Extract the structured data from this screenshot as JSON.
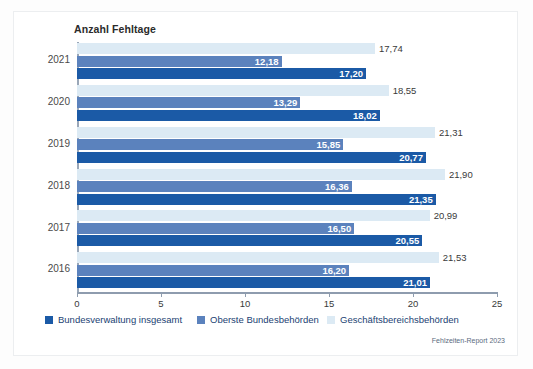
{
  "figure": {
    "title": "Anzahl Fehltage",
    "source_note": "Fehlzeiten-Report 2023"
  },
  "colors": {
    "dark": "#1b5aa6",
    "mid": "#5b82bd",
    "light": "#dceaf4",
    "axis": "#8e9cae",
    "card_background": "#ffffff",
    "page_background": "#fdfdfd"
  },
  "legend": {
    "items": [
      {
        "label": "Bundesverwaltung insgesamt",
        "color": "#1b5aa6",
        "key": "dark"
      },
      {
        "label": "Oberste Bundesbehörden",
        "color": "#5b82bd",
        "key": "mid"
      },
      {
        "label": "Geschäftsbereichsbehörden",
        "color": "#dceaf4",
        "key": "light"
      }
    ]
  },
  "axis": {
    "x_ticks": [
      "0",
      "5",
      "10",
      "15",
      "20",
      "25"
    ],
    "x_min": 0,
    "x_max": 25,
    "y_categories": [
      "2021",
      "2020",
      "2019",
      "2018",
      "2017",
      "2016"
    ]
  },
  "chart_data": {
    "type": "bar",
    "orientation": "horizontal",
    "title": "Anzahl Fehltage",
    "xlabel": "Anzahl Fehltage",
    "ylabel": "",
    "xlim": [
      0,
      25
    ],
    "grid": false,
    "legend_position": "bottom",
    "categories": [
      "2021",
      "2020",
      "2019",
      "2018",
      "2017",
      "2016"
    ],
    "series": [
      {
        "name": "Bundesverwaltung insgesamt",
        "color": "#1b5aa6",
        "values": [
          17.2,
          18.02,
          20.77,
          21.35,
          20.55,
          21.01
        ],
        "labels": [
          "17,20",
          "18,02",
          "20,77",
          "21,35",
          "20,55",
          "21,01"
        ]
      },
      {
        "name": "Oberste Bundesbehörden",
        "color": "#5b82bd",
        "values": [
          12.18,
          13.29,
          15.85,
          16.36,
          16.5,
          16.2
        ],
        "labels": [
          "12,18",
          "13,29",
          "15,85",
          "16,36",
          "16,50",
          "16,20"
        ]
      },
      {
        "name": "Geschäftsbereichsbehörden",
        "color": "#dceaf4",
        "values": [
          17.74,
          18.55,
          21.31,
          21.9,
          20.99,
          21.53
        ],
        "labels": [
          "17,74",
          "18,55",
          "21,31",
          "21,90",
          "20,99",
          "21,53"
        ]
      }
    ],
    "annotations": [
      "Fehlzeiten-Report 2023"
    ]
  },
  "groups": [
    {
      "year": "2021",
      "bars": [
        {
          "series": "Geschäftsbereichsbehörden",
          "key": "light",
          "value": 17.74,
          "label": "17,74"
        },
        {
          "series": "Oberste Bundesbehörden",
          "key": "mid",
          "value": 12.18,
          "label": "12,18"
        },
        {
          "series": "Bundesverwaltung insgesamt",
          "key": "dark",
          "value": 17.2,
          "label": "17,20"
        }
      ]
    },
    {
      "year": "2020",
      "bars": [
        {
          "series": "Geschäftsbereichsbehörden",
          "key": "light",
          "value": 18.55,
          "label": "18,55"
        },
        {
          "series": "Oberste Bundesbehörden",
          "key": "mid",
          "value": 13.29,
          "label": "13,29"
        },
        {
          "series": "Bundesverwaltung insgesamt",
          "key": "dark",
          "value": 18.02,
          "label": "18,02"
        }
      ]
    },
    {
      "year": "2019",
      "bars": [
        {
          "series": "Geschäftsbereichsbehörden",
          "key": "light",
          "value": 21.31,
          "label": "21,31"
        },
        {
          "series": "Oberste Bundesbehörden",
          "key": "mid",
          "value": 15.85,
          "label": "15,85"
        },
        {
          "series": "Bundesverwaltung insgesamt",
          "key": "dark",
          "value": 20.77,
          "label": "20,77"
        }
      ]
    },
    {
      "year": "2018",
      "bars": [
        {
          "series": "Geschäftsbereichsbehörden",
          "key": "light",
          "value": 21.9,
          "label": "21,90"
        },
        {
          "series": "Oberste Bundesbehörden",
          "key": "mid",
          "value": 16.36,
          "label": "16,36"
        },
        {
          "series": "Bundesverwaltung insgesamt",
          "key": "dark",
          "value": 21.35,
          "label": "21,35"
        }
      ]
    },
    {
      "year": "2017",
      "bars": [
        {
          "series": "Geschäftsbereichsbehörden",
          "key": "light",
          "value": 20.99,
          "label": "20,99"
        },
        {
          "series": "Oberste Bundesbehörden",
          "key": "mid",
          "value": 16.5,
          "label": "16,50"
        },
        {
          "series": "Bundesverwaltung insgesamt",
          "key": "dark",
          "value": 20.55,
          "label": "20,55"
        }
      ]
    },
    {
      "year": "2016",
      "bars": [
        {
          "series": "Geschäftsbereichsbehörden",
          "key": "light",
          "value": 21.53,
          "label": "21,53"
        },
        {
          "series": "Oberste Bundesbehörden",
          "key": "mid",
          "value": 16.2,
          "label": "16,20"
        },
        {
          "series": "Bundesverwaltung insgesamt",
          "key": "dark",
          "value": 21.01,
          "label": "21,01"
        }
      ]
    }
  ]
}
